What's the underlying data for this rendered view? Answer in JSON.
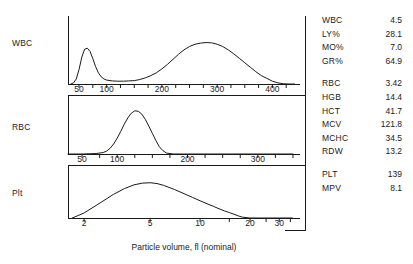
{
  "panels": [
    {
      "label": "WBC"
    },
    {
      "label": "RBC"
    },
    {
      "label": "Plt"
    }
  ],
  "xaxis_caption": "Particle volume, fl (nominal)",
  "results": [
    {
      "group": "wbc-differential",
      "rows": [
        {
          "name": "WBC",
          "value": "4.5"
        },
        {
          "name": "LY%",
          "value": "28.1"
        },
        {
          "name": "MO%",
          "value": "7.0"
        },
        {
          "name": "GR%",
          "value": "64.9"
        }
      ]
    },
    {
      "group": "red-cell-indices",
      "rows": [
        {
          "name": "RBC",
          "value": "3.42"
        },
        {
          "name": "HGB",
          "value": "14.4"
        },
        {
          "name": "HCT",
          "value": "41.7"
        },
        {
          "name": "MCV",
          "value": "121.8"
        },
        {
          "name": "MCHC",
          "value": "34.5"
        },
        {
          "name": "RDW",
          "value": "13.2"
        }
      ]
    },
    {
      "group": "platelet-indices",
      "rows": [
        {
          "name": "PLT",
          "value": "139"
        },
        {
          "name": "MPV",
          "value": "8.1"
        }
      ]
    }
  ],
  "chart_data": [
    {
      "type": "line",
      "name": "wbc-histogram",
      "title": "WBC",
      "xlabel": "Particle volume, fl (nominal)",
      "ylabel": "Relative frequency",
      "scale": "linear",
      "xlim": [
        30,
        450
      ],
      "ylim": [
        0,
        1
      ],
      "grid": false,
      "tick_labels": [
        "50",
        "100",
        "200",
        "300",
        "400"
      ],
      "tick_values": [
        50,
        100,
        200,
        300,
        400
      ],
      "minor_tick_values": [
        50,
        75,
        100,
        125,
        150,
        175,
        200,
        225,
        250,
        275,
        300,
        325,
        350,
        375,
        400,
        425
      ],
      "annotation": "Bimodal: narrow lymphocyte peak near 60 fl, broad granulocyte peak near 290 fl",
      "x": [
        35,
        40,
        45,
        50,
        55,
        60,
        65,
        70,
        75,
        80,
        85,
        90,
        95,
        100,
        110,
        120,
        130,
        140,
        150,
        160,
        170,
        180,
        190,
        200,
        210,
        220,
        230,
        240,
        250,
        260,
        270,
        280,
        290,
        300,
        310,
        320,
        330,
        340,
        350,
        360,
        370,
        380,
        390,
        400,
        410,
        420,
        430,
        440
      ],
      "y": [
        0.0,
        0.02,
        0.09,
        0.26,
        0.48,
        0.62,
        0.64,
        0.58,
        0.45,
        0.31,
        0.2,
        0.13,
        0.09,
        0.07,
        0.055,
        0.05,
        0.05,
        0.055,
        0.06,
        0.08,
        0.11,
        0.15,
        0.2,
        0.27,
        0.35,
        0.44,
        0.53,
        0.61,
        0.67,
        0.71,
        0.73,
        0.74,
        0.735,
        0.71,
        0.67,
        0.61,
        0.54,
        0.46,
        0.38,
        0.3,
        0.22,
        0.15,
        0.1,
        0.05,
        0.02,
        0.005,
        0.0,
        0.0
      ]
    },
    {
      "type": "line",
      "name": "rbc-histogram",
      "title": "RBC",
      "xlabel": "Particle volume, fl (nominal)",
      "ylabel": "Relative frequency",
      "scale": "linear",
      "xlim": [
        30,
        360
      ],
      "ylim": [
        0,
        1
      ],
      "grid": false,
      "tick_labels": [
        "50",
        "100",
        "200",
        "300"
      ],
      "tick_values": [
        50,
        100,
        200,
        300
      ],
      "minor_tick_values": [
        50,
        75,
        100,
        125,
        150,
        175,
        200,
        225,
        250,
        275,
        300,
        325,
        350
      ],
      "annotation": "Single unimodal peak near 128 fl, consistent with MCV 121.8",
      "x": [
        30,
        50,
        70,
        80,
        85,
        90,
        95,
        100,
        105,
        110,
        115,
        120,
        125,
        130,
        135,
        140,
        145,
        150,
        155,
        160,
        165,
        170,
        180,
        200,
        250,
        300,
        350
      ],
      "y": [
        0.0,
        0.0,
        0.01,
        0.03,
        0.06,
        0.12,
        0.21,
        0.33,
        0.47,
        0.62,
        0.75,
        0.85,
        0.9,
        0.89,
        0.83,
        0.72,
        0.58,
        0.43,
        0.28,
        0.15,
        0.07,
        0.02,
        0.0,
        0.0,
        0.0,
        0.0,
        0.0
      ]
    },
    {
      "type": "line",
      "name": "platelet-histogram",
      "title": "Plt",
      "xlabel": "Particle volume, fl (nominal)",
      "ylabel": "Relative frequency",
      "scale": "log",
      "xlim": [
        1.6,
        40
      ],
      "ylim": [
        0,
        1
      ],
      "grid": false,
      "tick_labels": [
        "2",
        "5",
        "10",
        "20",
        "30"
      ],
      "tick_values": [
        2,
        5,
        10,
        20,
        30
      ],
      "minor_tick_values": [
        2,
        5,
        10,
        15,
        20,
        25,
        30,
        35
      ],
      "annotation": "Right-skewed log-normal distribution peaking near 5 fl, tailing to 18 fl",
      "x": [
        1.7,
        2.0,
        2.5,
        3.0,
        3.5,
        4.0,
        4.5,
        5.0,
        5.5,
        6.0,
        7.0,
        8.0,
        9.0,
        10.0,
        11.0,
        12.0,
        13.0,
        14.0,
        15.0,
        16.0,
        17.0,
        18.0,
        20.0,
        25.0,
        30.0,
        36.0
      ],
      "y": [
        0.0,
        0.12,
        0.36,
        0.56,
        0.7,
        0.79,
        0.83,
        0.84,
        0.82,
        0.78,
        0.68,
        0.58,
        0.49,
        0.41,
        0.34,
        0.28,
        0.22,
        0.17,
        0.13,
        0.09,
        0.05,
        0.02,
        0.0,
        0.0,
        0.0,
        0.0
      ]
    }
  ]
}
